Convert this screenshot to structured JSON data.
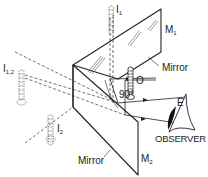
{
  "figure": {
    "colors": {
      "line": "#222222",
      "background": "#ffffff"
    }
  },
  "labels": {
    "image_1": {
      "main": "I",
      "sub": "1"
    },
    "image_12": {
      "main": "I",
      "sub": "1,2"
    },
    "image_2": {
      "main": "I",
      "sub": "2"
    },
    "mirror_1": {
      "main": "M",
      "sub": "1"
    },
    "mirror_2": {
      "main": "M",
      "sub": "2"
    },
    "mirror_1_caption": "Mirror",
    "mirror_2_caption": "Mirror",
    "object": "O",
    "angle": "90°",
    "eye": "E",
    "observer": "OBSERVER"
  }
}
